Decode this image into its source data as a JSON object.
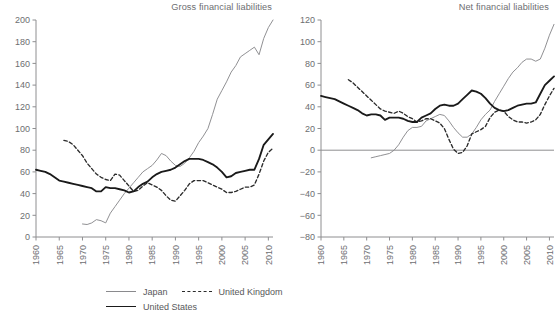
{
  "figure": {
    "width": 557,
    "height": 320,
    "background": "#ffffff"
  },
  "legend": {
    "position": "bottom-left",
    "entries": [
      {
        "label": "Japan",
        "style": "solid-thin",
        "color": "#8a8a8d"
      },
      {
        "label": "United Kingdom",
        "style": "dashed",
        "color": "#2b2b2b"
      },
      {
        "label": "United States",
        "style": "solid-thick",
        "color": "#1a1a1a"
      }
    ]
  },
  "chart_data": [
    {
      "type": "line",
      "title": "Gross financial liabilities",
      "xlabel": "",
      "ylabel": "",
      "xlim": [
        1960,
        2011
      ],
      "ylim": [
        0,
        200
      ],
      "yticks": [
        0,
        20,
        40,
        60,
        80,
        100,
        120,
        140,
        160,
        180,
        200
      ],
      "xticks": [
        1960,
        1965,
        1970,
        1975,
        1980,
        1985,
        1990,
        1995,
        2000,
        2005,
        2010
      ],
      "grid": false,
      "legend_position": "figure-bottom",
      "series": [
        {
          "name": "Japan",
          "color": "#8a8a8d",
          "style": "solid-thin",
          "x": [
            1970,
            1971,
            1972,
            1973,
            1974,
            1975,
            1976,
            1977,
            1978,
            1979,
            1980,
            1981,
            1982,
            1983,
            1984,
            1985,
            1986,
            1987,
            1988,
            1989,
            1990,
            1991,
            1992,
            1993,
            1994,
            1995,
            1996,
            1997,
            1998,
            1999,
            2000,
            2001,
            2002,
            2003,
            2004,
            2005,
            2006,
            2007,
            2008,
            2009,
            2010,
            2011
          ],
          "y": [
            12,
            11.5,
            13,
            16,
            15,
            13,
            22,
            28,
            34,
            40,
            45,
            50,
            55,
            60,
            63,
            66,
            71,
            77,
            75,
            70,
            66,
            65,
            68,
            73,
            79,
            87,
            93,
            100,
            113,
            127,
            135,
            143,
            152,
            158,
            166,
            169,
            172,
            175,
            168,
            183,
            193,
            200
          ]
        },
        {
          "name": "United Kingdom",
          "color": "#2b2b2b",
          "style": "dashed",
          "x": [
            1966,
            1967,
            1968,
            1969,
            1970,
            1971,
            1972,
            1973,
            1974,
            1975,
            1976,
            1977,
            1978,
            1979,
            1980,
            1981,
            1982,
            1983,
            1984,
            1985,
            1986,
            1987,
            1988,
            1989,
            1990,
            1991,
            1992,
            1993,
            1994,
            1995,
            1996,
            1997,
            1998,
            1999,
            2000,
            2001,
            2002,
            2003,
            2004,
            2005,
            2006,
            2007,
            2008,
            2009,
            2010,
            2011
          ],
          "y": [
            89,
            88,
            85,
            80,
            75,
            68,
            63,
            58,
            55,
            53,
            52,
            58,
            57,
            52,
            47,
            42,
            43,
            47,
            50,
            48,
            46,
            43,
            38,
            34,
            33,
            38,
            43,
            49,
            52,
            52,
            52,
            50,
            48,
            46,
            44,
            41,
            41,
            42,
            44,
            46,
            46,
            48,
            58,
            70,
            78,
            82
          ]
        },
        {
          "name": "United States",
          "color": "#1a1a1a",
          "style": "solid-thick",
          "x": [
            1960,
            1961,
            1962,
            1963,
            1964,
            1965,
            1966,
            1967,
            1968,
            1969,
            1970,
            1971,
            1972,
            1973,
            1974,
            1975,
            1976,
            1977,
            1978,
            1979,
            1980,
            1981,
            1982,
            1983,
            1984,
            1985,
            1986,
            1987,
            1988,
            1989,
            1990,
            1991,
            1992,
            1993,
            1994,
            1995,
            1996,
            1997,
            1998,
            1999,
            2000,
            2001,
            2002,
            2003,
            2004,
            2005,
            2006,
            2007,
            2008,
            2009,
            2010,
            2011
          ],
          "y": [
            62,
            61,
            60,
            58,
            55,
            52,
            51,
            50,
            49,
            48,
            47,
            46,
            45,
            42,
            42,
            46,
            45,
            45,
            44,
            43,
            41,
            42,
            46,
            49,
            51,
            55,
            58,
            60,
            61,
            62,
            64,
            67,
            70,
            72,
            72,
            72,
            71,
            69,
            67,
            64,
            60,
            55,
            56,
            59,
            60,
            61,
            62,
            62,
            72,
            85,
            90,
            95
          ]
        }
      ]
    },
    {
      "type": "line",
      "title": "Net financial liabilities",
      "xlabel": "",
      "ylabel": "",
      "xlim": [
        1960,
        2011
      ],
      "ylim": [
        -80,
        120
      ],
      "yticks": [
        -80,
        -60,
        -40,
        -20,
        0,
        20,
        40,
        60,
        80,
        100,
        120
      ],
      "xticks": [
        1960,
        1965,
        1970,
        1975,
        1980,
        1985,
        1990,
        1995,
        2000,
        2005,
        2010
      ],
      "grid": false,
      "zero_line": true,
      "legend_position": "figure-bottom",
      "series": [
        {
          "name": "Japan",
          "color": "#8a8a8d",
          "style": "solid-thin",
          "x": [
            1971,
            1972,
            1973,
            1974,
            1975,
            1976,
            1977,
            1978,
            1979,
            1980,
            1981,
            1982,
            1983,
            1984,
            1985,
            1986,
            1987,
            1988,
            1989,
            1990,
            1991,
            1992,
            1993,
            1994,
            1995,
            1996,
            1997,
            1998,
            1999,
            2000,
            2001,
            2002,
            2003,
            2004,
            2005,
            2006,
            2007,
            2008,
            2009,
            2010,
            2011
          ],
          "y": [
            -7,
            -6,
            -5,
            -4,
            -3,
            0,
            5,
            12,
            18,
            21,
            21,
            22,
            27,
            29,
            31,
            33,
            32,
            27,
            21,
            16,
            12,
            12,
            15,
            21,
            28,
            33,
            37,
            45,
            52,
            59,
            66,
            72,
            76,
            81,
            84,
            84,
            82,
            84,
            94,
            106,
            116
          ]
        },
        {
          "name": "United Kingdom",
          "color": "#2b2b2b",
          "style": "dashed",
          "x": [
            1966,
            1967,
            1968,
            1969,
            1970,
            1971,
            1972,
            1973,
            1974,
            1975,
            1976,
            1977,
            1978,
            1979,
            1980,
            1981,
            1982,
            1983,
            1984,
            1985,
            1986,
            1987,
            1988,
            1989,
            1990,
            1991,
            1992,
            1993,
            1994,
            1995,
            1996,
            1997,
            1998,
            1999,
            2000,
            2001,
            2002,
            2003,
            2004,
            2005,
            2006,
            2007,
            2008,
            2009,
            2010,
            2011
          ],
          "y": [
            65,
            62,
            58,
            54,
            50,
            46,
            42,
            38,
            36,
            35,
            34,
            36,
            34,
            31,
            29,
            26,
            27,
            29,
            29,
            27,
            25,
            20,
            10,
            1,
            -3,
            -2,
            4,
            15,
            17,
            19,
            22,
            30,
            35,
            37,
            36,
            31,
            28,
            26,
            26,
            25,
            26,
            28,
            33,
            42,
            50,
            57
          ]
        },
        {
          "name": "United States",
          "color": "#1a1a1a",
          "style": "solid-thick",
          "x": [
            1960,
            1961,
            1962,
            1963,
            1964,
            1965,
            1966,
            1967,
            1968,
            1969,
            1970,
            1971,
            1972,
            1973,
            1974,
            1975,
            1976,
            1977,
            1978,
            1979,
            1980,
            1981,
            1982,
            1983,
            1984,
            1985,
            1986,
            1987,
            1988,
            1989,
            1990,
            1991,
            1992,
            1993,
            1994,
            1995,
            1996,
            1997,
            1998,
            1999,
            2000,
            2001,
            2002,
            2003,
            2004,
            2005,
            2006,
            2007,
            2008,
            2009,
            2010,
            2011
          ],
          "y": [
            50,
            49,
            48,
            47,
            45,
            43,
            41,
            39,
            37,
            34,
            32,
            33,
            33,
            32,
            28,
            30,
            30,
            30,
            29,
            27,
            26,
            26,
            30,
            32,
            34,
            38,
            41,
            42,
            41,
            41,
            43,
            47,
            51,
            55,
            54,
            52,
            48,
            43,
            39,
            37,
            36,
            37,
            39,
            41,
            42,
            43,
            43,
            44,
            52,
            60,
            64,
            68
          ]
        }
      ]
    }
  ]
}
